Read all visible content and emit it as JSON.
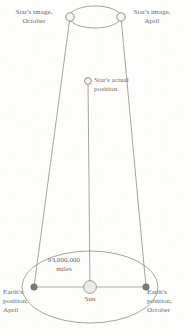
{
  "diagram": {
    "type": "astronomy-schematic",
    "background_color": "#fdfdfc",
    "ink_color": "#7a7672",
    "label_color": "#6e6a66"
  },
  "labels": {
    "star_image_october": "Star's image,\nOctober",
    "star_image_april": "Star's image,\nApril",
    "star_actual_position": "Star's actual\nposition",
    "distance_to_sun": "93,000,000\nmiles",
    "sun": "Sun",
    "earth_position_april": "Earth's\nposition,\nApril",
    "earth_position_october": "Earth's\nposition,\nOctober"
  },
  "markers": {
    "star_image_october": {
      "x": 70,
      "y": 17,
      "r": 4.2,
      "fill": "#f4f3f1",
      "stroke": "#7a7672"
    },
    "star_image_april": {
      "x": 121,
      "y": 17,
      "r": 4.2,
      "fill": "#f4f3f1",
      "stroke": "#7a7672"
    },
    "star_actual": {
      "x": 88,
      "y": 81,
      "r": 3.4,
      "fill": "#f4f3f1",
      "stroke": "#7a7672"
    },
    "sun": {
      "x": 90,
      "y": 287,
      "r": 6.4,
      "fill": "#ebe9e6",
      "stroke": "#8c8884"
    },
    "earth_april": {
      "x": 34,
      "y": 287,
      "r": 3.2,
      "fill": "#7d7873",
      "stroke": "#6b6661"
    },
    "earth_october": {
      "x": 146,
      "y": 287,
      "r": 3.2,
      "fill": "#7d7873",
      "stroke": "#6b6661"
    }
  },
  "geometry": {
    "celestial_sphere_ellipse": {
      "cx": 95,
      "cy": 17,
      "rx": 26,
      "ry": 11
    },
    "earth_orbit_ellipse": {
      "cx": 90,
      "cy": 287,
      "rx": 68,
      "ry": 36
    },
    "sight_line_april_to_image_october": {
      "x1": 34,
      "y1": 287,
      "x2": 70,
      "y2": 17
    },
    "sight_line_october_to_image_april": {
      "x1": 146,
      "y1": 287,
      "x2": 121,
      "y2": 17
    },
    "baseline_april_to_october": {
      "x1": 34,
      "y1": 287,
      "x2": 146,
      "y2": 287
    },
    "sun_to_star_axis": {
      "x1": 90,
      "y1": 287,
      "x2": 88,
      "y2": 81
    }
  },
  "label_positions": {
    "star_image_october": {
      "left": 5,
      "top": 8,
      "width": 58
    },
    "star_image_april": {
      "left": 124,
      "top": 8,
      "width": 56
    },
    "star_actual_position": {
      "left": 94,
      "top": 76,
      "width": 62
    },
    "distance_to_sun": {
      "left": 38,
      "top": 256,
      "width": 52
    },
    "sun": {
      "left": 78,
      "top": 295,
      "width": 24
    },
    "earth_position_april": {
      "left": 3,
      "top": 288,
      "width": 36
    },
    "earth_position_october": {
      "left": 147,
      "top": 288,
      "width": 38
    }
  }
}
